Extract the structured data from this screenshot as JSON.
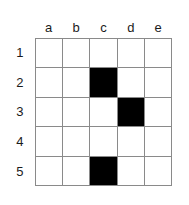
{
  "figure": {
    "name": "grid-puzzle",
    "colors": {
      "grid_line": "#8a8a8a",
      "filled_cell": "#000000",
      "empty_cell": "#ffffff",
      "label_text": "#1b1b1b",
      "background": "#ffffff"
    }
  },
  "grid": {
    "columns": 5,
    "rows": 5,
    "column_headers": [
      "a",
      "b",
      "c",
      "d",
      "e"
    ],
    "row_headers": [
      "1",
      "2",
      "3",
      "4",
      "5"
    ],
    "cells": [
      [
        "empty",
        "empty",
        "empty",
        "empty",
        "empty"
      ],
      [
        "empty",
        "empty",
        "filled",
        "empty",
        "empty"
      ],
      [
        "empty",
        "empty",
        "empty",
        "filled",
        "empty"
      ],
      [
        "empty",
        "empty",
        "empty",
        "empty",
        "empty"
      ],
      [
        "empty",
        "empty",
        "filled",
        "empty",
        "empty"
      ]
    ],
    "filled_cells": [
      "c2",
      "d3",
      "c5"
    ]
  }
}
